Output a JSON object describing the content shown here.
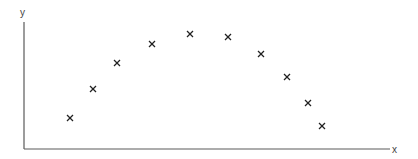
{
  "chart_data": {
    "type": "scatter",
    "title": "",
    "xlabel": "x",
    "ylabel": "y",
    "grid": false,
    "legend": null,
    "marker": "x",
    "note": "Schematic plot with no tick marks or numeric labels; values are positions measured in pixels from the axes origin.",
    "xlim": [
      0,
      366
    ],
    "ylim": [
      0,
      127
    ],
    "series": [
      {
        "name": "points",
        "x": [
          46,
          69,
          93,
          128,
          166,
          204,
          237,
          263,
          284,
          298
        ],
        "y": [
          31,
          60,
          86,
          105,
          115,
          112,
          95,
          72,
          46,
          23
        ]
      }
    ]
  },
  "colors": {
    "axis": "#5a5a5a",
    "marker": "#222222",
    "label": "#444444"
  },
  "layout": {
    "origin_px": [
      24,
      149
    ],
    "x_axis_end_px": 390,
    "y_axis_top_px": 22
  }
}
